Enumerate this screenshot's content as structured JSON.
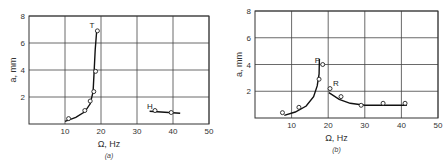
{
  "chart_data": [
    {
      "type": "scatter",
      "panel_label": "(a)",
      "xlabel": "Ω, Hz",
      "ylabel": "a, mm",
      "xlim": [
        0,
        50
      ],
      "ylim": [
        0,
        8
      ],
      "xticks": [
        10,
        20,
        30,
        40,
        50
      ],
      "yticks": [
        2,
        4,
        6,
        8
      ],
      "grid": true,
      "series": [
        {
          "name": "T branch",
          "annotation": "T",
          "points": [
            [
              11,
              0.4
            ],
            [
              15.5,
              1.0
            ],
            [
              17,
              1.7
            ],
            [
              18,
              2.4
            ],
            [
              18.5,
              3.9
            ],
            [
              19,
              6.9
            ]
          ],
          "curve": [
            [
              10,
              0.2
            ],
            [
              13,
              0.5
            ],
            [
              15.5,
              0.9
            ],
            [
              17,
              1.5
            ],
            [
              17.8,
              2.4
            ],
            [
              18.1,
              4.0
            ],
            [
              18.4,
              5.5
            ],
            [
              18.8,
              6.9
            ]
          ]
        },
        {
          "name": "H branch",
          "annotation": "H",
          "points": [
            [
              35,
              1.0
            ],
            [
              39.5,
              0.85
            ]
          ],
          "curve": [
            [
              33.5,
              0.95
            ],
            [
              42,
              0.8
            ]
          ]
        }
      ]
    },
    {
      "type": "scatter",
      "panel_label": "(b)",
      "xlabel": "Ω, Hz",
      "ylabel": "a, mm",
      "xlim": [
        0,
        50
      ],
      "ylim": [
        0,
        8
      ],
      "xticks": [
        10,
        20,
        30,
        40,
        50
      ],
      "yticks": [
        2,
        4,
        6,
        8
      ],
      "grid": true,
      "series": [
        {
          "name": "P branch",
          "annotation": "P",
          "points": [
            [
              7.5,
              0.4
            ],
            [
              12,
              0.8
            ],
            [
              17.5,
              2.9
            ],
            [
              18.5,
              4.0
            ]
          ],
          "curve": [
            [
              8,
              0.2
            ],
            [
              11,
              0.45
            ],
            [
              14,
              0.9
            ],
            [
              16,
              1.6
            ],
            [
              17,
              2.4
            ],
            [
              17.5,
              3.3
            ],
            [
              17.6,
              4.4
            ]
          ]
        },
        {
          "name": "R branch",
          "annotation": "R",
          "points": [
            [
              20.5,
              2.2
            ],
            [
              23.5,
              1.6
            ],
            [
              29,
              0.95
            ],
            [
              35,
              1.1
            ],
            [
              41,
              1.1
            ]
          ],
          "curve": [
            [
              20.2,
              1.9
            ],
            [
              23,
              1.4
            ],
            [
              26,
              1.1
            ],
            [
              30,
              0.95
            ],
            [
              35,
              0.95
            ],
            [
              41.5,
              0.95
            ]
          ]
        }
      ]
    }
  ]
}
